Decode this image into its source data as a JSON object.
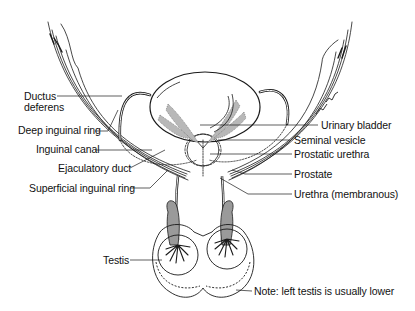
{
  "diagram": {
    "labels_left": [
      {
        "id": "ductus-deferens",
        "text_line1": "Ductus",
        "text_line2": "deferens"
      },
      {
        "id": "deep-inguinal-ring",
        "text": "Deep inguinal ring"
      },
      {
        "id": "inguinal-canal",
        "text": "Inguinal canal"
      },
      {
        "id": "ejaculatory-duct",
        "text": "Ejaculatory duct"
      },
      {
        "id": "superficial-inguinal-ring",
        "text": "Superficial inguinal ring"
      },
      {
        "id": "testis",
        "text": "Testis"
      }
    ],
    "labels_right": [
      {
        "id": "urinary-bladder",
        "text": "Urinary bladder"
      },
      {
        "id": "seminal-vesicle",
        "text": "Seminal vesicle"
      },
      {
        "id": "prostatic-urethra",
        "text": "Prostatic urethra"
      },
      {
        "id": "prostate",
        "text": "Prostate"
      },
      {
        "id": "urethra-membranous",
        "text": "Urethra (membranous)"
      },
      {
        "id": "note",
        "text": "Note: left testis is usually lower"
      }
    ],
    "colors": {
      "line": "#1a1a1a",
      "shade": "#b8b8b8",
      "background": "#ffffff"
    }
  }
}
